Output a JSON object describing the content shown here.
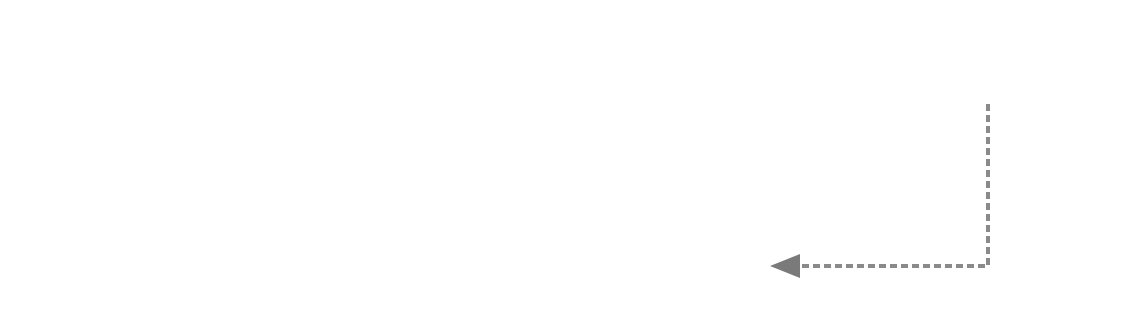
{
  "array_a": {
    "label": "a =",
    "indices": [
      "0",
      "1",
      "2",
      "3",
      "4",
      "5",
      "6",
      "7",
      "8",
      "9",
      "10",
      "11"
    ],
    "values": [
      "5",
      "11",
      "10",
      "9",
      "12",
      "25",
      "3",
      "4",
      "22",
      "2",
      "1",
      "18"
    ],
    "highlighted_range": [
      9,
      11
    ]
  },
  "sentence": "Accordingly, the new two-dimensional array will be as follows.",
  "array_b": {
    "label": "b =",
    "col_indices": [
      "0",
      "1",
      "2",
      "3"
    ],
    "row_indices": [
      "0",
      "1",
      "2"
    ],
    "rows": [
      [
        "5",
        "9",
        "3",
        "2"
      ],
      [
        "11",
        "12",
        "4",
        "1"
      ],
      [
        "10",
        "25",
        "22",
        "18"
      ]
    ],
    "highlighted_column": 3
  },
  "arrow": {
    "from": "a[9..11] group",
    "to": "b column 3",
    "style": "dashed",
    "color": "#808080"
  }
}
